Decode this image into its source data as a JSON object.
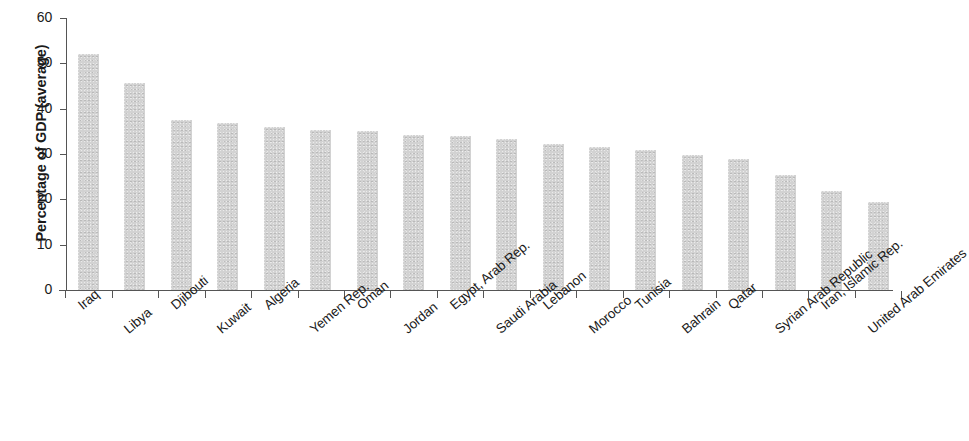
{
  "chart_data": {
    "type": "bar",
    "title": "",
    "xlabel": "",
    "ylabel": "Percentage of GDP (average)",
    "ylim": [
      0,
      60
    ],
    "yticks": [
      "0",
      "10",
      "20",
      "30",
      "40",
      "50",
      "60"
    ],
    "grid": false,
    "legend": "none",
    "categories": [
      "Iraq",
      "Libya",
      "Djibouti",
      "Kuwait",
      "Algeria",
      "Yemen Rep.",
      "Oman",
      "Jordan",
      "Egypt, Arab Rep.",
      "Saudi Arabia",
      "Lebanon",
      "Morocco",
      "Tunisia",
      "Bahrain",
      "Qatar",
      "Syrian Arab Republic",
      "Iran, Islamic Rep.",
      "United Arab Emirates"
    ],
    "values": [
      52.0,
      45.7,
      37.6,
      36.8,
      35.9,
      35.3,
      35.1,
      34.2,
      34.0,
      33.3,
      32.2,
      31.5,
      30.9,
      29.8,
      28.8,
      25.4,
      21.8,
      19.4
    ],
    "bar_color": "#d2d2d2",
    "axis_color": "#555555"
  }
}
